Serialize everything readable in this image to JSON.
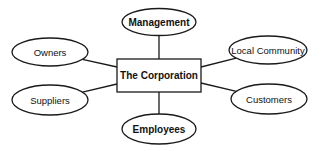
{
  "diagram": {
    "type": "stakeholder-map",
    "center": {
      "id": "corporation",
      "label": "The Corporation",
      "bold": true
    },
    "stakeholders": [
      {
        "id": "management",
        "label": "Management",
        "bold": true
      },
      {
        "id": "owners",
        "label": "Owners",
        "bold": false
      },
      {
        "id": "local-community",
        "label": "Local Community",
        "bold": false
      },
      {
        "id": "suppliers",
        "label": "Suppliers",
        "bold": false
      },
      {
        "id": "customers",
        "label": "Customers",
        "bold": false
      },
      {
        "id": "employees",
        "label": "Employees",
        "bold": true
      }
    ],
    "edges": [
      [
        "corporation",
        "management"
      ],
      [
        "corporation",
        "owners"
      ],
      [
        "corporation",
        "local-community"
      ],
      [
        "corporation",
        "suppliers"
      ],
      [
        "corporation",
        "customers"
      ],
      [
        "corporation",
        "employees"
      ]
    ]
  }
}
